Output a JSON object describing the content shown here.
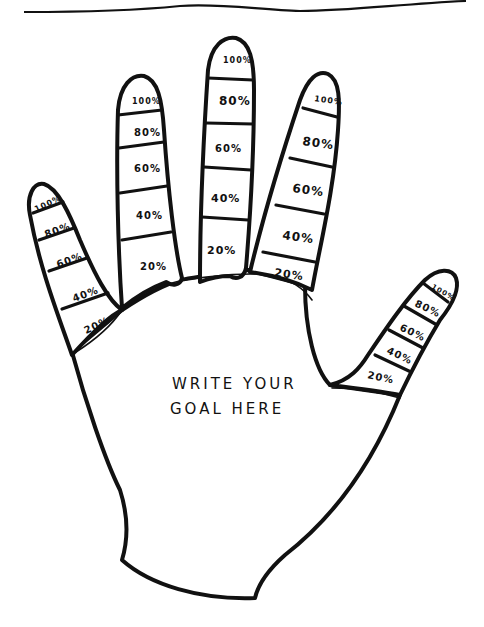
{
  "page": {
    "ink_color": "#111111",
    "paper_color": "#ffffff"
  },
  "palm": {
    "goal_line1": "WRITE YOUR",
    "goal_line2": "GOAL HERE"
  },
  "fingers": {
    "pinky": {
      "labels": [
        "100%",
        "80%",
        "60%",
        "40%",
        "20%"
      ]
    },
    "ring": {
      "labels": [
        "100%",
        "80%",
        "60%",
        "40%",
        "20%"
      ]
    },
    "middle": {
      "labels": [
        "100%",
        "80%",
        "60%",
        "40%",
        "20%"
      ]
    },
    "index": {
      "labels": [
        "100%",
        "80%",
        "60%",
        "40%",
        "20%"
      ]
    },
    "thumb": {
      "labels": [
        "100%",
        "80%",
        "60%",
        "40%",
        "20%"
      ]
    }
  }
}
